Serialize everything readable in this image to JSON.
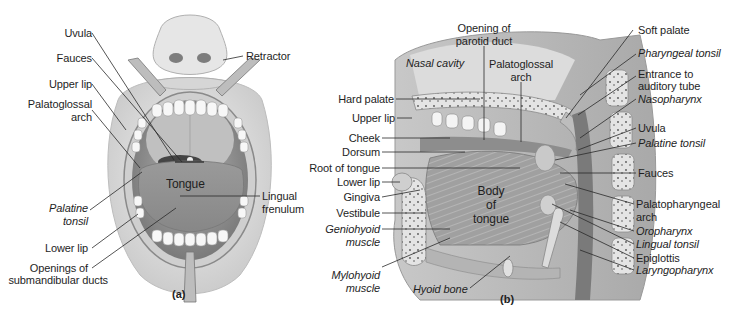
{
  "figure": {
    "panel_a": {
      "tag": "(a)",
      "labels": {
        "uvula": "Uvula",
        "fauces": "Fauces",
        "upper_lip": "Upper lip",
        "palatoglossal_arch_1": "Palatoglossal",
        "palatoglossal_arch_2": "arch",
        "palatine_tonsil_1": "Palatine",
        "palatine_tonsil_2": "tonsil",
        "lower_lip": "Lower lip",
        "openings_1": "Openings of",
        "openings_2": "submandibular ducts",
        "retractor": "Retractor",
        "tongue": "Tongue",
        "lingual_frenulum_1": "Lingual",
        "lingual_frenulum_2": "frenulum"
      }
    },
    "panel_b": {
      "tag": "(b)",
      "labels": {
        "opening_parotid_1": "Opening of",
        "opening_parotid_2": "parotid duct",
        "nasal_cavity": "Nasal cavity",
        "palatoglossal_arch_1": "Palatoglossal",
        "palatoglossal_arch_2": "arch",
        "hard_palate": "Hard palate",
        "upper_lip": "Upper lip",
        "cheek": "Cheek",
        "dorsum": "Dorsum",
        "root_of_tongue": "Root of tongue",
        "lower_lip": "Lower lip",
        "gingiva": "Gingiva",
        "vestibule": "Vestibule",
        "geniohyoid_1": "Geniohyoid",
        "geniohyoid_2": "muscle",
        "mylohyoid_1": "Mylohyoid",
        "mylohyoid_2": "muscle",
        "hyoid_bone": "Hyoid bone",
        "body_1": "Body",
        "body_2": "of",
        "body_3": "tongue",
        "soft_palate": "Soft palate",
        "pharyngeal_tonsil": "Pharyngeal tonsil",
        "auditory_1": "Entrance to",
        "auditory_2": "auditory tube",
        "nasopharynx": "Nasopharynx",
        "uvula": "Uvula",
        "palatine_tonsil": "Palatine tonsil",
        "fauces": "Fauces",
        "palatopharyngeal_1": "Palatopharyngeal",
        "palatopharyngeal_2": "arch",
        "oropharynx": "Oropharynx",
        "lingual_tonsil": "Lingual tonsil",
        "epiglottis": "Epiglottis",
        "laryngopharynx": "Laryngopharynx"
      }
    },
    "colors": {
      "background": "#ffffff",
      "ink": "#1e1e1e",
      "tissue_light": "#d9d9d9",
      "tissue_mid": "#a8a8a8",
      "tissue_dark": "#6e6e6e"
    }
  }
}
